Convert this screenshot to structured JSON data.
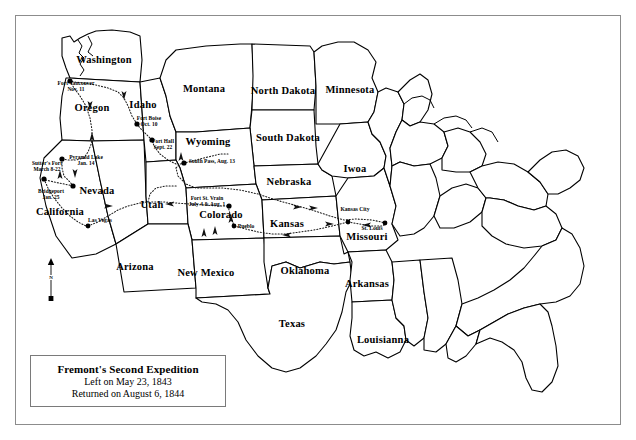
{
  "map": {
    "title_block": {
      "title": "Fremont's Second Expedition",
      "line1": "Left on May 23, 1843",
      "line2": "Returned on August 6, 1844"
    },
    "compass": {
      "north_label": "N"
    },
    "states": [
      {
        "name": "Washington",
        "x": 104,
        "y": 60,
        "size": "big"
      },
      {
        "name": "Oregon",
        "x": 92,
        "y": 108,
        "size": "big"
      },
      {
        "name": "Idaho",
        "x": 143,
        "y": 105,
        "size": "big"
      },
      {
        "name": "Montana",
        "x": 204,
        "y": 89,
        "size": "big"
      },
      {
        "name": "North Dakota",
        "x": 283,
        "y": 91,
        "size": "big"
      },
      {
        "name": "Minnesota",
        "x": 350,
        "y": 90,
        "size": "big"
      },
      {
        "name": "South Dakota",
        "x": 288,
        "y": 138,
        "size": "big"
      },
      {
        "name": "Wyoming",
        "x": 208,
        "y": 142,
        "size": "big"
      },
      {
        "name": "Nebraska",
        "x": 289,
        "y": 182,
        "size": "big"
      },
      {
        "name": "Iwoa",
        "x": 355,
        "y": 169,
        "size": "big"
      },
      {
        "name": "Nevada",
        "x": 97,
        "y": 191,
        "size": "big"
      },
      {
        "name": "Utah",
        "x": 152,
        "y": 205,
        "size": "big"
      },
      {
        "name": "Colorado",
        "x": 221,
        "y": 215,
        "size": "big"
      },
      {
        "name": "Kansas",
        "x": 287,
        "y": 224,
        "size": "big"
      },
      {
        "name": "Missouri",
        "x": 367,
        "y": 237,
        "size": "big"
      },
      {
        "name": "California",
        "x": 60,
        "y": 212,
        "size": "big"
      },
      {
        "name": "Arizona",
        "x": 135,
        "y": 267,
        "size": "big"
      },
      {
        "name": "New Mexico",
        "x": 206,
        "y": 273,
        "size": "big"
      },
      {
        "name": "Oklahoma",
        "x": 305,
        "y": 271,
        "size": "big"
      },
      {
        "name": "Arkansas",
        "x": 367,
        "y": 284,
        "size": "big"
      },
      {
        "name": "Texas",
        "x": 292,
        "y": 324,
        "size": "big"
      },
      {
        "name": "Louisianna",
        "x": 383,
        "y": 340,
        "size": "big"
      }
    ],
    "sites": [
      {
        "id": "fort-vancouver",
        "name": "Fort Vancouver",
        "date": "Nov. 11",
        "label_x": 76,
        "label_y": 87,
        "dot_x": 70,
        "dot_y": 81,
        "align": "center"
      },
      {
        "id": "fort-boise",
        "name": "Fort Boise",
        "date": "Oct. 10",
        "label_x": 149,
        "label_y": 122,
        "dot_x": 137,
        "dot_y": 124,
        "align": "center"
      },
      {
        "id": "fort-hall",
        "name": "Fort Hall",
        "date": "Sept. 22",
        "label_x": 163,
        "label_y": 145,
        "dot_x": 152,
        "dot_y": 140,
        "align": "center"
      },
      {
        "id": "pyramid-lake",
        "name": "Pyramid Lake",
        "date": "Jan. 14",
        "label_x": 86,
        "label_y": 161,
        "dot_x": 62,
        "dot_y": 159,
        "align": "center"
      },
      {
        "id": "sutters-fort",
        "name": "Sutter's Fort",
        "date": "March 8-22",
        "label_x": 47,
        "label_y": 167,
        "dot_x": 44,
        "dot_y": 179,
        "align": "center"
      },
      {
        "id": "bridgeport",
        "name": "Bridgeport",
        "date": "Jan. 25",
        "label_x": 51,
        "label_y": 195,
        "dot_x": 73,
        "dot_y": 186,
        "align": "center"
      },
      {
        "id": "south-pass",
        "name": "South Pass, Aug. 13",
        "date": "",
        "label_x": 212,
        "label_y": 162,
        "dot_x": 184,
        "dot_y": 163,
        "align": "center"
      },
      {
        "id": "fort-st-vrain",
        "name": "Fort St. Vrain",
        "date": "July 4 & Aug. 1",
        "label_x": 207,
        "label_y": 202,
        "dot_x": 229,
        "dot_y": 206,
        "align": "center"
      }
    ],
    "cities": [
      {
        "id": "las-vegas",
        "name": "Las Vegas",
        "label_x": 100,
        "label_y": 221,
        "dot_x": 88,
        "dot_y": 226
      },
      {
        "id": "pueblo",
        "name": "Pueblo",
        "label_x": 246,
        "label_y": 227,
        "dot_x": 234,
        "dot_y": 226
      },
      {
        "id": "kansas-city",
        "name": "Kansas City",
        "label_x": 355,
        "label_y": 210,
        "dot_x": 348,
        "dot_y": 222
      },
      {
        "id": "st-louis",
        "name": "St. Louis",
        "label_x": 372,
        "label_y": 229,
        "dot_x": 385,
        "dot_y": 223
      }
    ],
    "colors": {
      "ink": "#000000",
      "frame": "#8c8c8c",
      "paper": "#ffffff",
      "route": "#2a2a2a"
    }
  }
}
